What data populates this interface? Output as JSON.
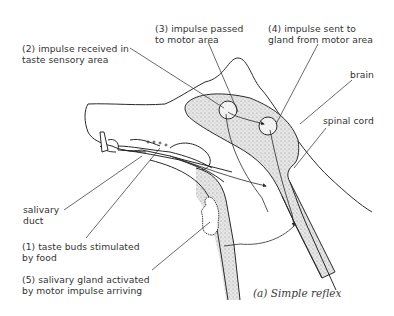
{
  "diagram": {
    "caption": "(a) Simple reflex",
    "labels": {
      "step3": "(3) impulse passed\nto motor area",
      "step4": "(4) impulse sent to\ngland from motor area",
      "step2": "(2) impulse received in\ntaste sensory area",
      "brain": "brain",
      "spinal_cord": "spinal cord",
      "salivary_duct": "salivary\nduct",
      "step1": "(1) taste buds stimulated\nby food",
      "step5": "(5) salivary gland activated\nby motor impulse arriving"
    },
    "colors": {
      "line": "#2a2a2a",
      "stipple": "#d8d8d8",
      "text": "#333333",
      "background": "#ffffff"
    }
  }
}
